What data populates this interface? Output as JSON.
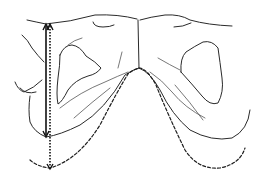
{
  "diagram": {
    "type": "anatomical-line-drawing",
    "colors": {
      "background": "#ffffff",
      "line": "#2a2a2a",
      "arrow": "#111111"
    },
    "elements": {
      "solid_arrow": {
        "style": "solid",
        "direction": "double-headed",
        "x": 46,
        "y_top": 25,
        "y_bottom": 136
      },
      "dotted_arrow": {
        "style": "dotted",
        "direction": "double-headed",
        "x": 50,
        "y_top": 25,
        "y_bottom": 168
      },
      "dashed_curve": {
        "style": "dashed",
        "shape": "inverted-V arch",
        "peak": [
          140,
          68
        ]
      },
      "midline": {
        "x": 138,
        "y_top": 20,
        "y_bottom": 68
      }
    },
    "labels": []
  }
}
